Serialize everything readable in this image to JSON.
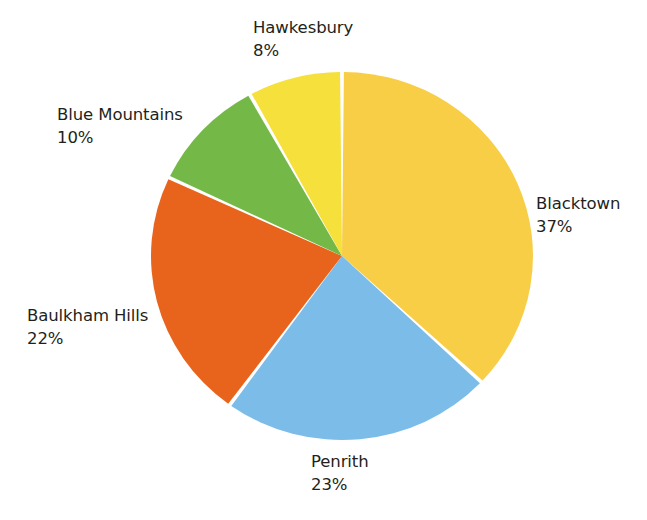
{
  "chart_data": {
    "type": "pie",
    "title": "",
    "subtitle": "",
    "xlabel": "",
    "ylabel": "",
    "legend_position": "none",
    "labels_position": "outside",
    "grid": false,
    "value_suffix": "%",
    "start_angle_deg": 0,
    "direction": "clockwise",
    "categories": [
      "Blacktown",
      "Penrith",
      "Baulkham Hills",
      "Blue Mountains",
      "Hawkesbury"
    ],
    "values": [
      37,
      23,
      22,
      10,
      8
    ],
    "slices": [
      {
        "name": "Blacktown",
        "value": 37,
        "value_label": "37%",
        "color": "#f7ce46",
        "start_deg": 0,
        "end_deg": 133.2
      },
      {
        "name": "Penrith",
        "value": 23,
        "value_label": "23%",
        "color": "#7cbce8",
        "start_deg": 133.2,
        "end_deg": 216.0
      },
      {
        "name": "Baulkham Hills",
        "value": 22,
        "value_label": "22%",
        "color": "#e8641c",
        "start_deg": 216.0,
        "end_deg": 295.2
      },
      {
        "name": "Blue Mountains",
        "value": 10,
        "value_label": "10%",
        "color": "#74b948",
        "start_deg": 295.2,
        "end_deg": 331.2
      },
      {
        "name": "Hawkesbury",
        "value": 8,
        "value_label": "8%",
        "color": "#f5e03c",
        "start_deg": 331.2,
        "end_deg": 360.0
      }
    ]
  },
  "labels": {
    "blacktown": {
      "name": "Blacktown",
      "percent": "37%"
    },
    "penrith": {
      "name": "Penrith",
      "percent": "23%"
    },
    "baulkham_hills": {
      "name": "Baulkham Hills",
      "percent": "22%"
    },
    "blue_mountains": {
      "name": "Blue Mountains",
      "percent": "10%"
    },
    "hawkesbury": {
      "name": "Hawkesbury",
      "percent": "8%"
    }
  },
  "colors": {
    "background": "#ffffff",
    "text": "#231f20",
    "separator": "#ffffff",
    "blacktown": "#f7ce46",
    "penrith": "#7cbce8",
    "baulkham_hills": "#e8641c",
    "blue_mountains": "#74b948",
    "hawkesbury": "#f5e03c"
  }
}
